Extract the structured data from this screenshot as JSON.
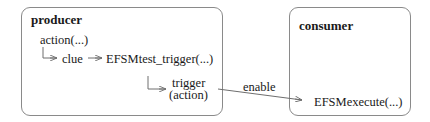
{
  "diagram": {
    "producer": {
      "title": "producer",
      "action": "action(...)",
      "clue": "clue",
      "test_trigger": "EFSMtest_trigger(...)",
      "trigger_line1": "trigger",
      "trigger_line2": "(action)"
    },
    "consumer": {
      "title": "consumer",
      "execute": "EFSMexecute(...)"
    },
    "edge_label": "enable",
    "colors": {
      "box_border": "#8a8a8a",
      "line": "#6e6e6e",
      "text": "#1a1a1a"
    }
  }
}
